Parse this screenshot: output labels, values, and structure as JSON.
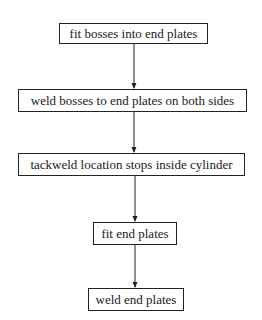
{
  "flowchart": {
    "steps": [
      {
        "label": "fit bosses into end plates"
      },
      {
        "label": "weld bosses to end plates on both sides"
      },
      {
        "label": "tackweld location stops inside cylinder"
      },
      {
        "label": "fit end plates"
      },
      {
        "label": "weld end plates"
      }
    ],
    "colors": {
      "line": "#222222",
      "background": "#ffffff"
    }
  }
}
